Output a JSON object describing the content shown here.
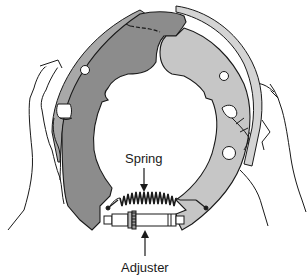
{
  "figure": {
    "colors": {
      "primary_shoe": "#8c8c8c",
      "secondary_shoe": "#c6c6c6",
      "lining": "#a8a8a8",
      "lining_light": "#d4d4d4",
      "outline": "#1a1a1a",
      "background": "#ffffff"
    },
    "labels": {
      "spring": "Spring",
      "adjuster": "Adjuster"
    },
    "components": [
      "left-brake-shoe",
      "right-brake-shoe",
      "spring",
      "adjuster",
      "left-hand",
      "right-hand"
    ]
  }
}
